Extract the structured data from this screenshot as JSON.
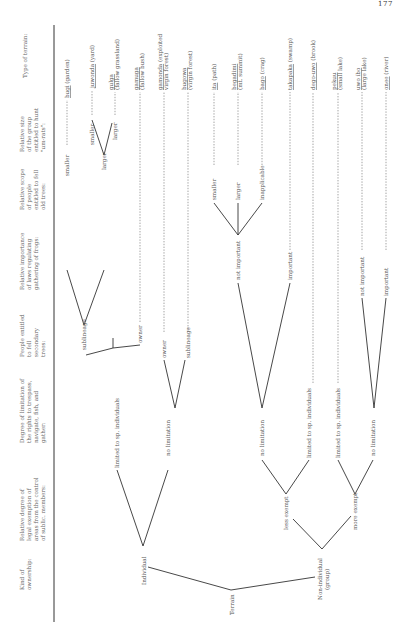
{
  "page_number": "177",
  "columns": [
    {
      "id": "c0",
      "x": 24,
      "lines": [
        "Kind of",
        "ownership:"
      ]
    },
    {
      "id": "c1",
      "x": 24,
      "lines": [
        "Relative degree of",
        "legal exemption of",
        "areas from the control",
        "of sublic. members:"
      ]
    },
    {
      "id": "c2",
      "x": 24,
      "lines": [
        "Degree of limitation of",
        "the rights to trespass,",
        "navigate, fish, and",
        "gather:"
      ]
    },
    {
      "id": "c3",
      "x": 24,
      "lines": [
        "People entitled",
        "to fell",
        "secondary",
        "trees:"
      ]
    },
    {
      "id": "c4",
      "x": 24,
      "lines": [
        "Relative importance",
        "of laws regulating",
        "gathering of frogs:"
      ]
    },
    {
      "id": "c5",
      "x": 24,
      "lines": [
        "Relative scope",
        "of people",
        "entitled to fell",
        "old trees:"
      ]
    },
    {
      "id": "c6",
      "x": 24,
      "lines": [
        "Relative size",
        "of the group",
        "entitled to hunt",
        "\"um-rats\":"
      ]
    },
    {
      "id": "c7",
      "x": 24,
      "lines": [
        "Type of terrain:"
      ]
    }
  ],
  "tree": {
    "root": "Terrain",
    "level1": [
      "Individual",
      "Non-individual (group)"
    ],
    "level2": [
      "less exempt",
      "more exempt"
    ],
    "level3": [
      "limited to sp. individuals",
      "no limitation",
      "no limitation",
      "limited to sp. individuals",
      "limited to sp. individuals",
      "no limitation"
    ],
    "level4": [
      "sublineage",
      "owner",
      "owner",
      "sublineage"
    ],
    "level5": [
      "not important",
      "important",
      "not important",
      "important"
    ],
    "level6": [
      "smaller",
      "larger",
      "smaller",
      "larger",
      "inapplicable"
    ],
    "level7": [
      "smaller",
      "larger"
    ]
  },
  "terrains": [
    {
      "name": "bugi",
      "gloss": "(garden)"
    },
    {
      "name": "juwonda",
      "gloss": "(yard)"
    },
    {
      "name": "gulga",
      "gloss": "(fallow grassland)"
    },
    {
      "name": "gamuga",
      "gloss": "(fallow bush)"
    },
    {
      "name": "gamonda",
      "gloss": "(exploited virgin forest)"
    },
    {
      "name": "bugowa",
      "gloss": "(virgin forest)"
    },
    {
      "name": "ita",
      "gloss": "(path)"
    },
    {
      "name": "begadimi",
      "gloss": "(mt. summit)"
    },
    {
      "name": "bago",
      "gloss": "(crag)"
    },
    {
      "name": "takapaka",
      "gloss": "(swamp)"
    },
    {
      "name": "dego-uwo",
      "gloss": "(brook)"
    },
    {
      "name": "pekuu",
      "gloss": "(small lake)"
    },
    {
      "name": "uwo ibo",
      "gloss": "(large lake)"
    },
    {
      "name": "onee",
      "gloss": "(river)"
    }
  ]
}
